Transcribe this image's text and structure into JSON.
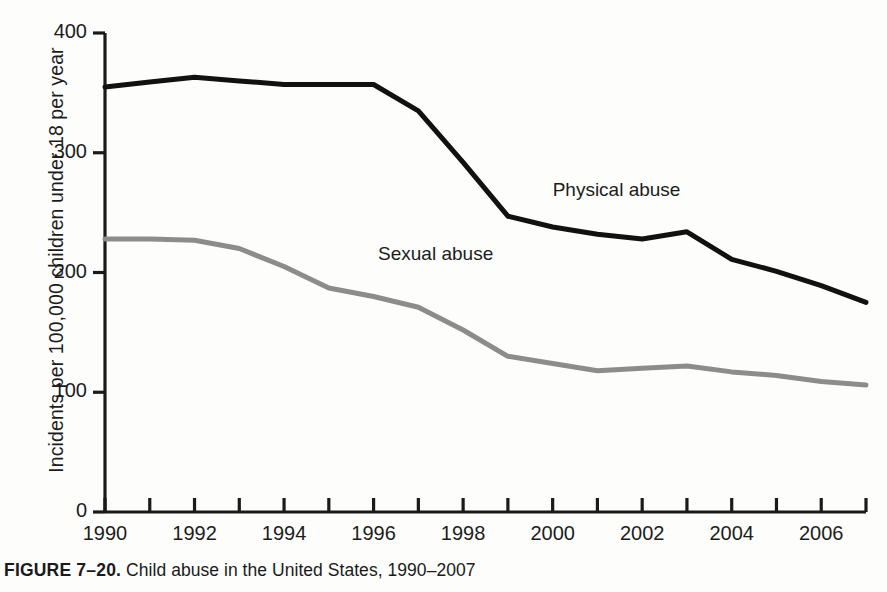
{
  "caption": {
    "figure_number": "FIGURE 7–20.",
    "text": "Child abuse in the United States, 1990–2007"
  },
  "chart_data": {
    "type": "line",
    "title": "Child abuse in the United States, 1990–2007",
    "xlabel": "",
    "ylabel": "Incidents per 100,000 children under 18 per year",
    "xlim": [
      1990,
      2007
    ],
    "ylim": [
      0,
      400
    ],
    "grid": false,
    "legend_position": "inline-annotation",
    "x": [
      1990,
      1991,
      1992,
      1993,
      1994,
      1995,
      1996,
      1997,
      1998,
      1999,
      2000,
      2001,
      2002,
      2003,
      2004,
      2005,
      2006,
      2007
    ],
    "xticks": [
      1990,
      1991,
      1992,
      1993,
      1994,
      1995,
      1996,
      1997,
      1998,
      1999,
      2000,
      2001,
      2002,
      2003,
      2004,
      2005,
      2006,
      2007
    ],
    "xtick_labels": [
      "1990",
      "",
      "1992",
      "",
      "1994",
      "",
      "1996",
      "",
      "1998",
      "",
      "2000",
      "",
      "2002",
      "",
      "2004",
      "",
      "2006",
      ""
    ],
    "yticks": [
      0,
      100,
      200,
      300,
      400
    ],
    "ytick_labels": [
      "0",
      "100",
      "200",
      "300",
      "400"
    ],
    "series": [
      {
        "name": "Physical abuse",
        "color": "#111111",
        "width": 5,
        "label_x": 2000.0,
        "label_y": 268,
        "values": [
          355,
          359,
          363,
          360,
          357,
          357,
          357,
          335,
          292,
          247,
          238,
          232,
          228,
          234,
          211,
          201,
          189,
          175
        ]
      },
      {
        "name": "Sexual abuse",
        "color": "#8c8c8c",
        "width": 5,
        "label_x": 1996.1,
        "label_y": 215,
        "values": [
          228,
          228,
          227,
          220,
          205,
          187,
          180,
          171,
          152,
          130,
          124,
          118,
          120,
          122,
          117,
          114,
          109,
          106
        ]
      }
    ]
  }
}
